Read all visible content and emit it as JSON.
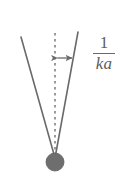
{
  "figure": {
    "background_color": "#ffffff",
    "line_color": "#6a6a6a",
    "dash_color": "#7a7a7a",
    "pivot_color": "#6e6e6e",
    "text_color": "#5d5d5d",
    "width": 120,
    "height": 195
  },
  "labels": {
    "angle_numerator": "1",
    "angle_denominator": "ka",
    "angle_expression": "1/ka"
  },
  "geometry": {
    "pivot": {
      "cx": 55,
      "cy": 162,
      "r": 9
    },
    "axis_dashed": {
      "x": 55,
      "y_top": 33,
      "y_bottom": 156
    },
    "left_ray": {
      "x1": 55,
      "y1": 158,
      "x2": 21,
      "y2": 37
    },
    "right_ray": {
      "x1": 55,
      "y1": 158,
      "x2": 78,
      "y2": 32
    },
    "angle_arrow": {
      "x1": 56,
      "y": 58,
      "x2": 74,
      "double_headed": true
    }
  }
}
